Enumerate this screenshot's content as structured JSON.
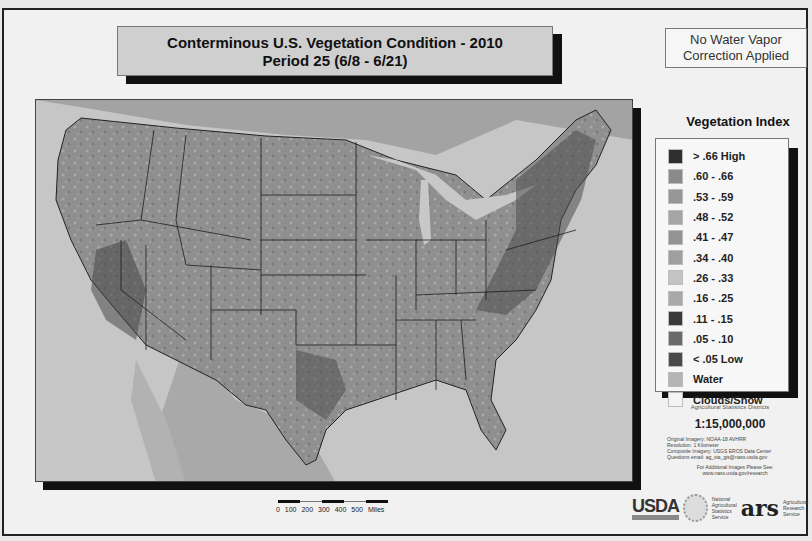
{
  "header": {
    "title_line1": "Conterminous U.S. Vegetation Condition - 2010",
    "title_line2": "Period 25 (6/8 - 6/21)",
    "note_line1": "No Water Vapor",
    "note_line2": "Correction Applied"
  },
  "legend": {
    "title": "Vegetation Index",
    "items": [
      {
        "label": "> .66  High",
        "color": "#2f2f2f"
      },
      {
        "label": ".60 - .66",
        "color": "#8a8a8a"
      },
      {
        "label": ".53 - .59",
        "color": "#979797"
      },
      {
        "label": ".48 - .52",
        "color": "#a5a5a5"
      },
      {
        "label": ".41 - .47",
        "color": "#939393"
      },
      {
        "label": ".34 - .40",
        "color": "#9f9f9f"
      },
      {
        "label": ".26 - .33",
        "color": "#c4c4c4"
      },
      {
        "label": ".16 - .25",
        "color": "#a9a9a9"
      },
      {
        "label": ".11 - .15",
        "color": "#3a3a3a"
      },
      {
        "label": ".05 - .10",
        "color": "#6a6a6a"
      },
      {
        "label": "< .05  Low",
        "color": "#4a4a4a"
      },
      {
        "label": "Water",
        "color": "#b4b4b4"
      },
      {
        "label": "Clouds/Snow",
        "color": "#f4f4f4"
      }
    ]
  },
  "info": {
    "stats_label": "Agricultural Statistics Districts",
    "scale": "1:15,000,000",
    "credit_lines": [
      "Original Imagery: NOAA-18 AVHRR",
      "Resolution: 1 Kilometer",
      "Composite Imagery: USGS EROS Data Center",
      "Questions email: ag_sta_gis@nass.usda.gov"
    ],
    "additional_line1": "For Additional Images Please See:",
    "additional_line2": "www.nass.usda.gov/research"
  },
  "logos": {
    "usda": "USDA",
    "nass_text": "National Agricultural Statistics Service",
    "ars": "ars",
    "ars_text": "Agricultural Research Service"
  },
  "scalebar": {
    "labels": "0 100 200 300 400 500 Miles"
  },
  "map": {
    "land_color": "#8f8f8f",
    "water_color": "#bdbdbd",
    "border_color": "#1e1e1e"
  }
}
